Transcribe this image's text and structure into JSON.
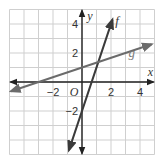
{
  "chart_data": {
    "type": "line",
    "title": "",
    "xlabel": "x",
    "ylabel": "y",
    "origin_label": "O",
    "xlim": [
      -5,
      5
    ],
    "ylim": [
      -5,
      5
    ],
    "grid": true,
    "x_ticks": [
      {
        "value": -2,
        "label": "−2"
      },
      {
        "value": 2,
        "label": "2"
      },
      {
        "value": 4,
        "label": "4"
      }
    ],
    "y_ticks": [
      {
        "value": 4,
        "label": "4"
      },
      {
        "value": 2,
        "label": "2"
      },
      {
        "value": -2,
        "label": "−2"
      }
    ],
    "series": [
      {
        "name": "f",
        "equation": "y = 3x - 2",
        "slope": 3,
        "intercept": -2,
        "color": "#3a3a3a",
        "x_range": [
          -0.9,
          2.1
        ]
      },
      {
        "name": "g",
        "equation": "y = x/3 + 1",
        "slope": 0.3333,
        "intercept": 1,
        "color": "#6b6b6b",
        "x_range": [
          -4.9,
          4.8
        ]
      }
    ],
    "legend": "inline labels"
  }
}
